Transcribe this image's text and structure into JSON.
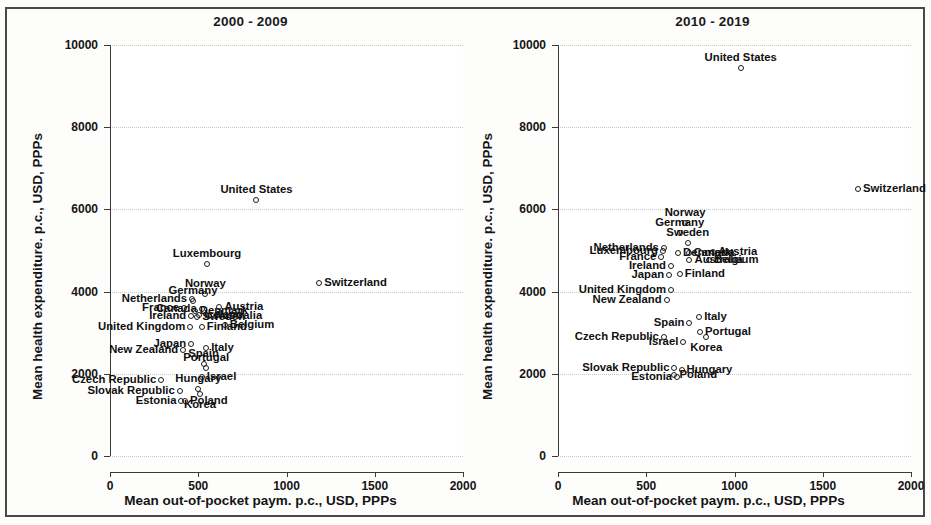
{
  "figure": {
    "background_color": "#fdfdfc",
    "border_color": "#4a4a4a",
    "marker_color": "#1b1b1b",
    "grid_color": "#c9c9c9",
    "axis_color": "#3a3a3a"
  },
  "axes": {
    "xlabel": "Mean out-of-pocket paym. p.c., USD, PPPs",
    "ylabel": "Mean health expenditure. p.c., USD, PPPs",
    "xticks": [
      "0",
      "500",
      "1000",
      "1500",
      "2000"
    ],
    "yticks": [
      "0",
      "2000",
      "4000",
      "6000",
      "8000",
      "10000"
    ],
    "xlim": [
      0,
      2000
    ],
    "ylim": [
      0,
      10000
    ]
  },
  "chart_data": [
    {
      "type": "scatter",
      "title": "2000 - 2009",
      "xlabel": "Mean out-of-pocket paym. p.c., USD, PPPs",
      "ylabel": "Mean health expenditure. p.c., USD, PPPs",
      "xlim": [
        0,
        2000
      ],
      "ylim": [
        0,
        10000
      ],
      "xticks": [
        0,
        500,
        1000,
        1500,
        2000
      ],
      "yticks": [
        0,
        2000,
        4000,
        6000,
        8000,
        10000
      ],
      "grid": true,
      "legend": "none",
      "marker": "open-circle",
      "points": [
        {
          "label": "United States",
          "x": 830,
          "y": 6230,
          "pos": "n"
        },
        {
          "label": "Luxembourg",
          "x": 550,
          "y": 4680,
          "pos": "n"
        },
        {
          "label": "Switzerland",
          "x": 1185,
          "y": 4220,
          "pos": "w"
        },
        {
          "label": "Norway",
          "x": 540,
          "y": 3930,
          "pos": "n"
        },
        {
          "label": "Netherlands",
          "x": 465,
          "y": 3820,
          "pos": "e"
        },
        {
          "label": "Germany",
          "x": 470,
          "y": 3760,
          "pos": "n"
        },
        {
          "label": "Austria",
          "x": 620,
          "y": 3620,
          "pos": "w"
        },
        {
          "label": "Canada",
          "x": 520,
          "y": 3580,
          "pos": "e"
        },
        {
          "label": "France",
          "x": 420,
          "y": 3600,
          "pos": "e"
        },
        {
          "label": "Denmark",
          "x": 480,
          "y": 3520,
          "pos": "w"
        },
        {
          "label": "Iceland",
          "x": 505,
          "y": 3420,
          "pos": "w"
        },
        {
          "label": "Australia",
          "x": 560,
          "y": 3400,
          "pos": "w"
        },
        {
          "label": "Ireland",
          "x": 460,
          "y": 3400,
          "pos": "e"
        },
        {
          "label": "Sweden",
          "x": 495,
          "y": 3380,
          "pos": "w"
        },
        {
          "label": "Belgium",
          "x": 650,
          "y": 3180,
          "pos": "w"
        },
        {
          "label": "Finland",
          "x": 520,
          "y": 3150,
          "pos": "w"
        },
        {
          "label": "United Kingdom",
          "x": 455,
          "y": 3150,
          "pos": "e"
        },
        {
          "label": "Japan",
          "x": 460,
          "y": 2720,
          "pos": "e"
        },
        {
          "label": "Italy",
          "x": 545,
          "y": 2620,
          "pos": "w"
        },
        {
          "label": "New Zealand",
          "x": 415,
          "y": 2580,
          "pos": "e"
        },
        {
          "label": "Spain",
          "x": 530,
          "y": 2250,
          "pos": "n"
        },
        {
          "label": "Portugal",
          "x": 545,
          "y": 2150,
          "pos": "n"
        },
        {
          "label": "Israel",
          "x": 520,
          "y": 1930,
          "pos": "w"
        },
        {
          "label": "Czech Republic",
          "x": 290,
          "y": 1850,
          "pos": "e"
        },
        {
          "label": "Hungary",
          "x": 500,
          "y": 1630,
          "pos": "n"
        },
        {
          "label": "Slovak Republic",
          "x": 395,
          "y": 1590,
          "pos": "e"
        },
        {
          "label": "Korea",
          "x": 510,
          "y": 1520,
          "pos": "s"
        },
        {
          "label": "Poland",
          "x": 425,
          "y": 1350,
          "pos": "w"
        },
        {
          "label": "Estonia",
          "x": 405,
          "y": 1330,
          "pos": "e"
        }
      ]
    },
    {
      "type": "scatter",
      "title": "2010 - 2019",
      "xlabel": "Mean out-of-pocket paym. p.c., USD, PPPs",
      "ylabel": "Mean health expenditure. p.c., USD, PPPs",
      "xlim": [
        0,
        2000
      ],
      "ylim": [
        0,
        10000
      ],
      "xticks": [
        0,
        500,
        1000,
        1500,
        2000
      ],
      "yticks": [
        0,
        2000,
        4000,
        6000,
        8000,
        10000
      ],
      "grid": true,
      "legend": "none",
      "marker": "open-circle",
      "points": [
        {
          "label": "United States",
          "x": 1035,
          "y": 9440,
          "pos": "n"
        },
        {
          "label": "Switzerland",
          "x": 1700,
          "y": 6500,
          "pos": "w"
        },
        {
          "label": "Norway",
          "x": 720,
          "y": 5660,
          "pos": "n"
        },
        {
          "label": "Germany",
          "x": 690,
          "y": 5420,
          "pos": "n"
        },
        {
          "label": "Sweden",
          "x": 735,
          "y": 5180,
          "pos": "n"
        },
        {
          "label": "Netherlands",
          "x": 600,
          "y": 5060,
          "pos": "e"
        },
        {
          "label": "Luxembourg",
          "x": 595,
          "y": 5000,
          "pos": "e"
        },
        {
          "label": "Austria",
          "x": 880,
          "y": 4970,
          "pos": "w"
        },
        {
          "label": "Denmark",
          "x": 680,
          "y": 4940,
          "pos": "w"
        },
        {
          "label": "Canada",
          "x": 740,
          "y": 4930,
          "pos": "w"
        },
        {
          "label": "France",
          "x": 585,
          "y": 4840,
          "pos": "e"
        },
        {
          "label": "Belgium",
          "x": 855,
          "y": 4760,
          "pos": "w"
        },
        {
          "label": "Australia",
          "x": 745,
          "y": 4760,
          "pos": "w"
        },
        {
          "label": "Ireland",
          "x": 640,
          "y": 4620,
          "pos": "e"
        },
        {
          "label": "Finland",
          "x": 690,
          "y": 4420,
          "pos": "w"
        },
        {
          "label": "Japan",
          "x": 630,
          "y": 4400,
          "pos": "e"
        },
        {
          "label": "United Kingdom",
          "x": 640,
          "y": 4030,
          "pos": "e"
        },
        {
          "label": "New Zealand",
          "x": 615,
          "y": 3800,
          "pos": "e"
        },
        {
          "label": "Italy",
          "x": 800,
          "y": 3390,
          "pos": "w"
        },
        {
          "label": "Spain",
          "x": 745,
          "y": 3240,
          "pos": "e"
        },
        {
          "label": "Portugal",
          "x": 805,
          "y": 3020,
          "pos": "w"
        },
        {
          "label": "Czech Republic",
          "x": 600,
          "y": 2900,
          "pos": "e"
        },
        {
          "label": "Korea",
          "x": 840,
          "y": 2890,
          "pos": "s"
        },
        {
          "label": "Israel",
          "x": 710,
          "y": 2770,
          "pos": "e"
        },
        {
          "label": "Slovak Republic",
          "x": 660,
          "y": 2130,
          "pos": "e"
        },
        {
          "label": "Hungary",
          "x": 700,
          "y": 2090,
          "pos": "w"
        },
        {
          "label": "Poland",
          "x": 660,
          "y": 1960,
          "pos": "w"
        },
        {
          "label": "Estonia",
          "x": 675,
          "y": 1930,
          "pos": "e"
        }
      ]
    }
  ]
}
